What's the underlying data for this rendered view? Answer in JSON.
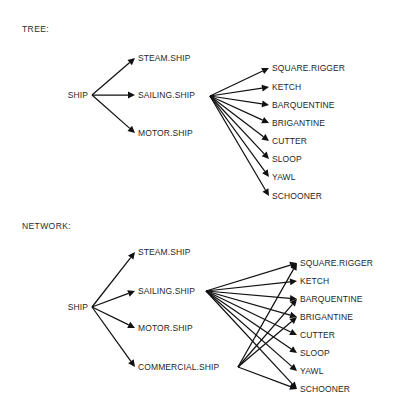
{
  "figure": {
    "background_color": "#ffffff",
    "line_color": "#111111",
    "text_color": "#1f1f1f",
    "width": 397,
    "height": 415
  },
  "panels": {
    "tree": {
      "heading": "TREE:",
      "root": {
        "label": "SHIP",
        "x": 88,
        "y": 95
      },
      "level1": [
        {
          "label": "STEAM.SHIP",
          "x": 138,
          "y": 58
        },
        {
          "label": "SAILING.SHIP",
          "x": 138,
          "y": 95
        },
        {
          "label": "MOTOR.SHIP",
          "x": 138,
          "y": 133
        }
      ],
      "hub": {
        "x": 210,
        "y": 96
      },
      "leaves": [
        {
          "label": "SQUARE.RIGGER",
          "x": 272,
          "y": 68
        },
        {
          "label": "KETCH",
          "x": 272,
          "y": 87
        },
        {
          "label": "BARQUENTINE",
          "x": 272,
          "y": 105
        },
        {
          "label": "BRIGANTINE",
          "x": 272,
          "y": 123
        },
        {
          "label": "CUTTER",
          "x": 272,
          "y": 141
        },
        {
          "label": "SLOOP",
          "x": 272,
          "y": 159
        },
        {
          "label": "YAWL",
          "x": 272,
          "y": 177
        },
        {
          "label": "SCHOONER",
          "x": 272,
          "y": 196
        }
      ]
    },
    "network": {
      "heading": "NETWORK:",
      "root": {
        "label": "SHIP",
        "x": 88,
        "y": 307
      },
      "level1": [
        {
          "label": "STEAM.SHIP",
          "x": 138,
          "y": 252
        },
        {
          "label": "SAILING.SHIP",
          "x": 138,
          "y": 291
        },
        {
          "label": "MOTOR.SHIP",
          "x": 138,
          "y": 328
        },
        {
          "label": "COMMERCIAL.SHIP",
          "x": 138,
          "y": 367
        }
      ],
      "hubs": {
        "sailing": {
          "x": 206,
          "y": 291
        },
        "commercial": {
          "x": 238,
          "y": 367
        }
      },
      "leaves": [
        {
          "label": "SQUARE.RIGGER",
          "x": 300,
          "y": 263
        },
        {
          "label": "KETCH",
          "x": 300,
          "y": 281
        },
        {
          "label": "BARQUENTINE",
          "x": 300,
          "y": 299
        },
        {
          "label": "BRIGANTINE",
          "x": 300,
          "y": 317
        },
        {
          "label": "CUTTER",
          "x": 300,
          "y": 335
        },
        {
          "label": "SLOOP",
          "x": 300,
          "y": 353
        },
        {
          "label": "YAWL",
          "x": 300,
          "y": 371
        },
        {
          "label": "SCHOONER",
          "x": 300,
          "y": 389
        }
      ],
      "edges_from_sailing": [
        "SQUARE.RIGGER",
        "KETCH",
        "BARQUENTINE",
        "BRIGANTINE",
        "CUTTER",
        "SLOOP",
        "YAWL",
        "SCHOONER"
      ],
      "edges_from_commercial": [
        "SQUARE.RIGGER",
        "BARQUENTINE",
        "BRIGANTINE",
        "SCHOONER"
      ]
    }
  }
}
